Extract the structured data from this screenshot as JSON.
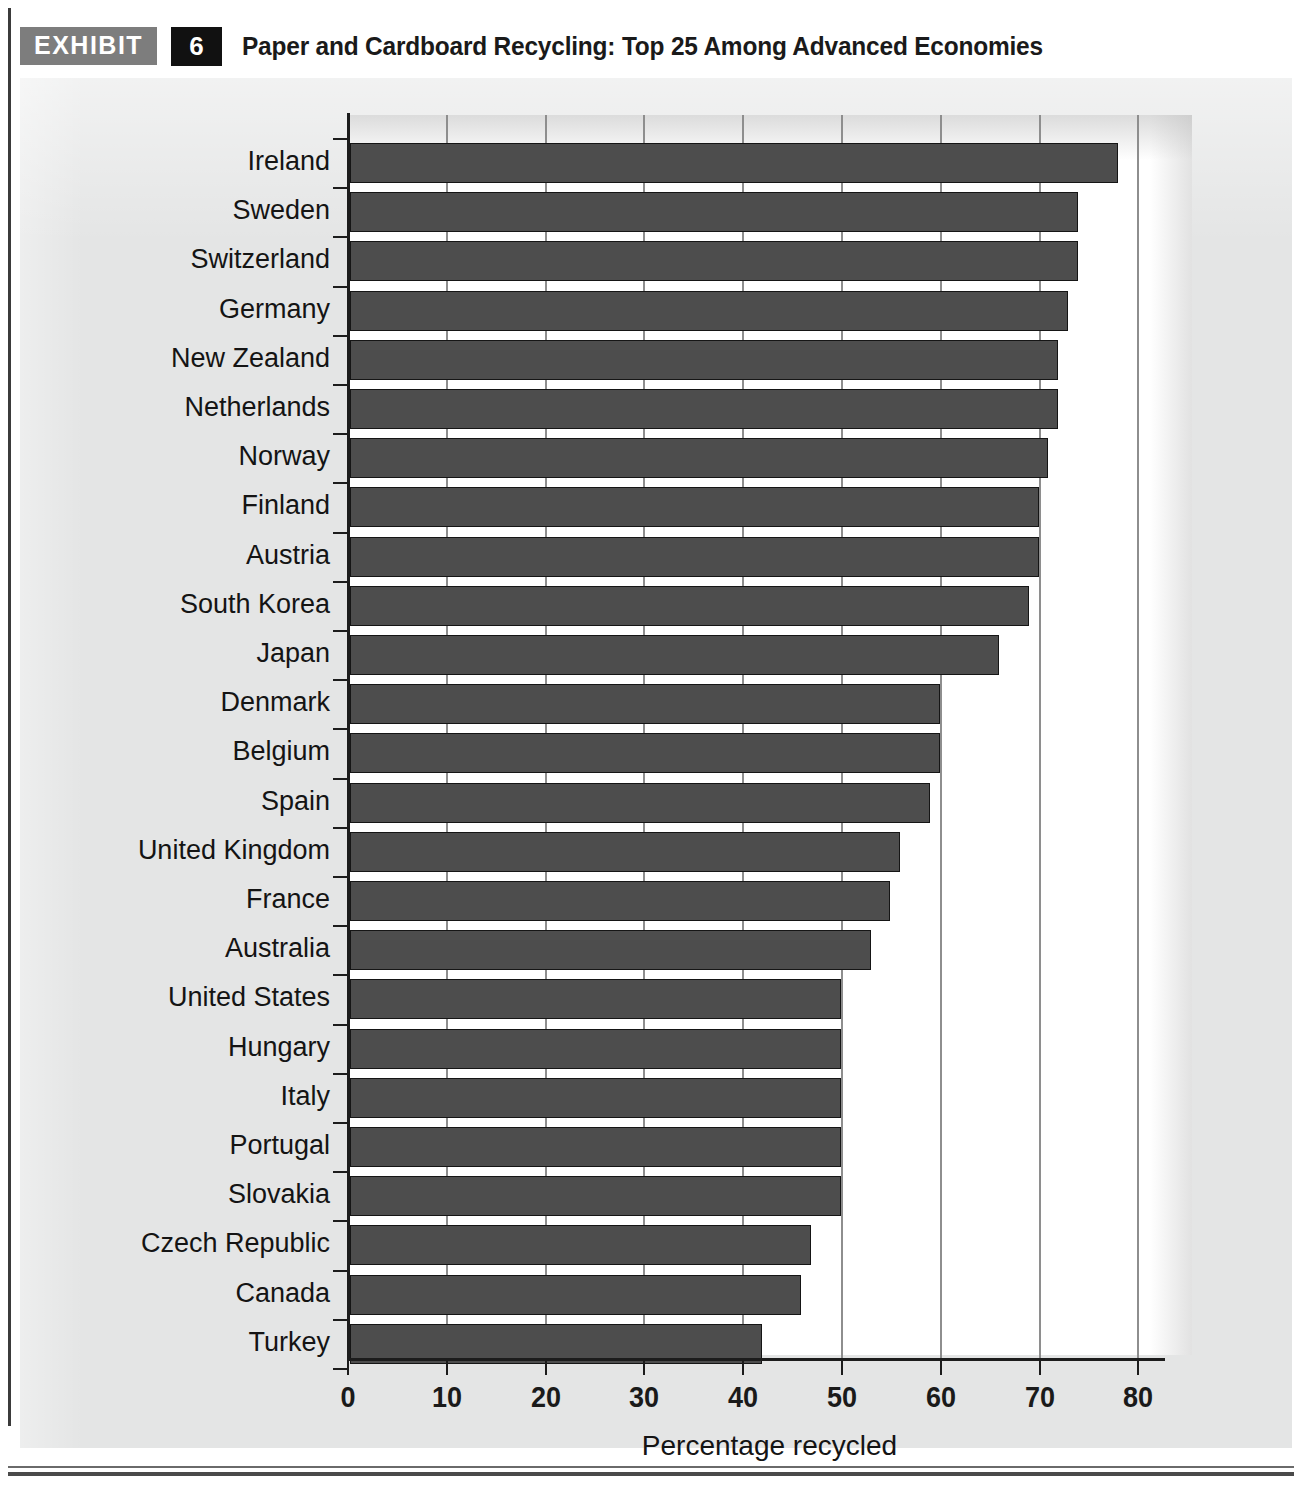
{
  "header": {
    "exhibit_label": "EXHIBIT",
    "exhibit_number": "6",
    "title": "Paper and Cardboard Recycling: Top 25 Among Advanced Economies"
  },
  "colors": {
    "bar_fill": "#4d4d4d",
    "bar_border": "#151515",
    "card_background": "#e4e5e5",
    "plot_background": "#ffffff",
    "gridline": "#8e8e8e",
    "axis": "#1c1c1c",
    "exhibit_tag_background": "#7d7d7d",
    "exhibit_number_background": "#111111"
  },
  "chart_data": {
    "type": "bar",
    "orientation": "horizontal",
    "title": "Paper and Cardboard Recycling: Top 25 Among Advanced Economies",
    "xlabel": "Percentage recycled",
    "ylabel": "",
    "xlim": [
      0,
      83
    ],
    "xticks": [
      0,
      10,
      20,
      30,
      40,
      50,
      60,
      70,
      80
    ],
    "xtick_labels": [
      "0",
      "10",
      "20",
      "30",
      "40",
      "50",
      "60",
      "70",
      "80"
    ],
    "grid": "vertical",
    "legend": "none",
    "categories": [
      "Ireland",
      "Sweden",
      "Switzerland",
      "Germany",
      "New Zealand",
      "Netherlands",
      "Norway",
      "Finland",
      "Austria",
      "South Korea",
      "Japan",
      "Denmark",
      "Belgium",
      "Spain",
      "United Kingdom",
      "France",
      "Australia",
      "United States",
      "Hungary",
      "Italy",
      "Portugal",
      "Slovakia",
      "Czech Republic",
      "Canada",
      "Turkey"
    ],
    "values": [
      78,
      74,
      74,
      73,
      72,
      72,
      71,
      70,
      70,
      69,
      66,
      60,
      60,
      59,
      56,
      55,
      53,
      50,
      50,
      50,
      50,
      50,
      47,
      46,
      42
    ]
  }
}
